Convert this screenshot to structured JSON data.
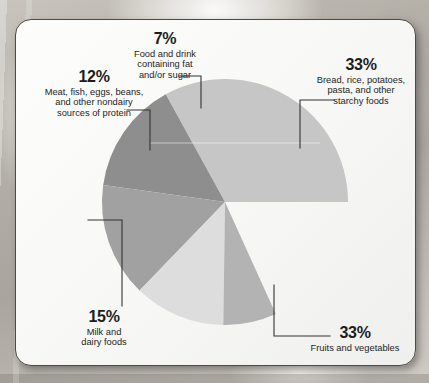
{
  "page": {
    "card_background": "#fafafa",
    "card_border": "#4a4a4a"
  },
  "chart_data": {
    "type": "pie",
    "title": "",
    "subtitle": "",
    "xlabel": "",
    "ylabel": "",
    "legend_position": "callout-labels",
    "grid": false,
    "center": [
      225,
      202
    ],
    "radius": 123,
    "total": 100,
    "units": "%",
    "categories": [
      "Bread, rice, potatoes, pasta, and other starchy foods",
      "Fruits and vegetables",
      "Milk and dairy foods",
      "Meat, fish, eggs, beans, and other nondairy sources of protein",
      "Food and drink containing fat and/or sugar"
    ],
    "values": [
      33,
      33,
      15,
      12,
      7
    ],
    "colors": [
      "#c6c6c6",
      "#8e8e8e",
      "#a1a1a1",
      "#dddddd",
      "#b3b3b3"
    ],
    "slices": [
      {
        "id": "starchy",
        "percent_label": "33%",
        "value": 33,
        "name": "Bread, rice, potatoes, pasta, and other starchy foods",
        "label_lines": [
          "Bread, rice, potatoes,",
          "pasta, and other",
          "starchy foods"
        ],
        "color": "#c6c6c6",
        "start_angle_deg": 0,
        "end_angle_deg": 118.8
      },
      {
        "id": "fruits-vegetables",
        "percent_label": "33%",
        "value": 33,
        "name": "Fruits and vegetables",
        "label_lines": [
          "Fruits and vegetables"
        ],
        "color": "#8e8e8e",
        "start_angle_deg": 118.8,
        "end_angle_deg": 172.0
      },
      {
        "id": "milk-dairy",
        "percent_label": "15%",
        "value": 15,
        "name": "Milk and dairy foods",
        "label_lines": [
          "Milk and",
          "dairy foods"
        ],
        "color": "#a1a1a1",
        "start_angle_deg": 172.0,
        "end_angle_deg": 226.0
      },
      {
        "id": "protein",
        "percent_label": "12%",
        "value": 12,
        "name": "Meat, fish, eggs, beans, and other nondairy sources of protein",
        "label_lines": [
          "Meat, fish, eggs, beans,",
          "and other nondairy",
          "sources of protein"
        ],
        "color": "#dddddd",
        "start_angle_deg": 226.0,
        "end_angle_deg": 269.2
      },
      {
        "id": "fat-sugar",
        "percent_label": "7%",
        "value": 7,
        "name": "Food and drink containing fat and/or sugar",
        "label_lines": [
          "Food and drink",
          "containing fat",
          "and/or sugar"
        ],
        "color": "#b3b3b3",
        "start_angle_deg": 269.2,
        "end_angle_deg": 294.4
      }
    ]
  },
  "labels": {
    "fat_sugar": {
      "percent": "7%",
      "line1": "Food and drink",
      "line2": "containing fat",
      "line3": "and/or sugar"
    },
    "protein": {
      "percent": "12%",
      "line1": "Meat, fish, eggs, beans,",
      "line2": "and other nondairy",
      "line3": "sources of protein"
    },
    "starchy": {
      "percent": "33%",
      "line1": "Bread, rice, potatoes,",
      "line2": "pasta, and other",
      "line3": "starchy foods"
    },
    "milk": {
      "percent": "15%",
      "line1": "Milk and",
      "line2": "dairy foods"
    },
    "fruits": {
      "percent": "33%",
      "line1": "Fruits and vegetables"
    }
  }
}
